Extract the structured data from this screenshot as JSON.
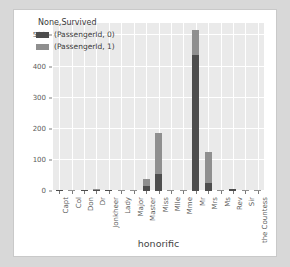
{
  "chart_data": {
    "type": "bar",
    "subtype": "stacked-bar",
    "title": "",
    "xlabel": "honorific",
    "ylabel": "",
    "ylim": [
      0,
      540
    ],
    "yticks": [
      0,
      100,
      200,
      300,
      400,
      500
    ],
    "grid": true,
    "legend_position": "upper-left",
    "legend_title": "None,Survived",
    "categories": [
      "Capt",
      "Col",
      "Don",
      "Dr",
      "Jonkheer",
      "Lady",
      "Major",
      "Master",
      "Miss",
      "Mlle",
      "Mme",
      "Mr",
      "Mrs",
      "Ms",
      "Rev",
      "Sir",
      "the Countess"
    ],
    "series": [
      {
        "name": "(PassengerId, 0)",
        "color": "#4d4d4d",
        "values": [
          1,
          1,
          1,
          4,
          1,
          0,
          1,
          17,
          55,
          0,
          0,
          436,
          26,
          0,
          6,
          0,
          0
        ]
      },
      {
        "name": "(PassengerId, 1)",
        "color": "#8f8f8f",
        "values": [
          0,
          1,
          0,
          3,
          0,
          1,
          1,
          23,
          130,
          2,
          1,
          81,
          101,
          1,
          0,
          1,
          1
        ]
      }
    ],
    "totals": [
      1,
      2,
      1,
      7,
      1,
      1,
      2,
      40,
      185,
      2,
      1,
      517,
      127,
      1,
      6,
      1,
      1
    ]
  },
  "legend": {
    "title": "None,Survived",
    "entries": [
      {
        "label": "(PassengerId, 0)",
        "color": "#4d4d4d"
      },
      {
        "label": "(PassengerId, 1)",
        "color": "#8f8f8f"
      }
    ]
  },
  "axes": {
    "x_title": "honorific",
    "y_tick_labels": [
      "500",
      "400",
      "300",
      "200",
      "100",
      "0"
    ],
    "x_tick_labels": [
      "Capt",
      "Col",
      "Don",
      "Dr",
      "Jonkheer",
      "Lady",
      "Major",
      "Master",
      "Miss",
      "Mlle",
      "Mme",
      "Mr",
      "Mrs",
      "Ms",
      "Rev",
      "Sir",
      "the Countess"
    ]
  },
  "colors": {
    "page_background": "#d8d8d8",
    "figure_background": "#ffffff",
    "plot_background": "#eaeaea",
    "gridline": "#ffffff",
    "tick_text": "#5b5b5b",
    "series_died": "#4d4d4d",
    "series_survived": "#8f8f8f"
  }
}
